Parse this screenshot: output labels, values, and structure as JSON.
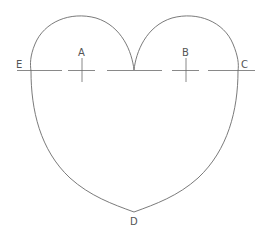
{
  "diagram": {
    "stroke_color": "#6b6b6b",
    "label_color": "#555555",
    "points": {
      "A": {
        "label": "A",
        "x": 82,
        "y": 70
      },
      "B": {
        "label": "B",
        "x": 186,
        "y": 70
      },
      "C": {
        "label": "C",
        "x": 238,
        "y": 70
      },
      "D": {
        "label": "D",
        "x": 134,
        "y": 212
      },
      "E": {
        "label": "E",
        "x": 31,
        "y": 70
      }
    },
    "labels": {
      "A": "A",
      "B": "B",
      "C": "C",
      "D": "D",
      "E": "E"
    },
    "baseline_y": 70,
    "baseline_dashes": [
      [
        17,
        62
      ],
      [
        68,
        95
      ],
      [
        107,
        162
      ],
      [
        172,
        199
      ],
      [
        208,
        255
      ]
    ]
  }
}
